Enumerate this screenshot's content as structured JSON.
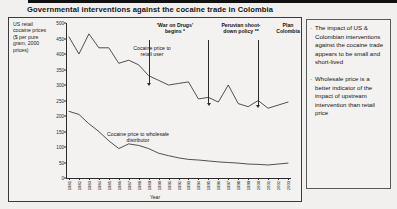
{
  "slide": {
    "title": "Governmental interventions against the cocaine trade in Colombia"
  },
  "chart_data": {
    "type": "line",
    "title": "Governmental interventions against the cocaine trade in Colombia",
    "xlabel": "Year",
    "ylabel": "US retail cocaine prices ($ per pure gram, 2000 prices)",
    "ylim": [
      0,
      500
    ],
    "yticks": [
      500,
      450,
      400,
      350,
      300,
      250,
      200,
      150,
      100,
      50,
      0
    ],
    "grid": false,
    "legend": "inline-labels",
    "categories": [
      "1981",
      "1982",
      "1983",
      "1984",
      "1985",
      "1986",
      "1987",
      "1988",
      "1989",
      "1990",
      "1991",
      "1992",
      "1993",
      "1994",
      "1995",
      "1996",
      "1997",
      "1998",
      "1999",
      "2000",
      "2001",
      "2002",
      "2003"
    ],
    "series": [
      {
        "name": "Cocaine price to retail user",
        "values": [
          455,
          400,
          465,
          420,
          420,
          370,
          380,
          365,
          330,
          315,
          300,
          305,
          310,
          255,
          260,
          245,
          300,
          240,
          230,
          250,
          225,
          235,
          245
        ]
      },
      {
        "name": "Cocaine price to wholesale distributor",
        "values": [
          215,
          205,
          175,
          150,
          120,
          95,
          110,
          105,
          95,
          80,
          72,
          65,
          60,
          58,
          55,
          52,
          50,
          48,
          45,
          44,
          42,
          45,
          48
        ]
      }
    ],
    "annotations": [
      {
        "label": "'War on Drugs' begins *",
        "year": "1989"
      },
      {
        "label": "Peruvian shoot-down policy **",
        "year": "1995"
      },
      {
        "label": "Plan Colombia",
        "year": "2000"
      }
    ],
    "series_labels": [
      {
        "text": "Cocaine price to retail user"
      },
      {
        "text": "Cocaine price to wholesale distributor"
      }
    ]
  },
  "notes": {
    "bullet_glyph": "·",
    "items": [
      "The impact of US & Colombian interventions against the cocaine trade appears to be small and short-lived",
      "Wholesale price is a better indicator of the impact of upstream intervention than retail price"
    ]
  }
}
